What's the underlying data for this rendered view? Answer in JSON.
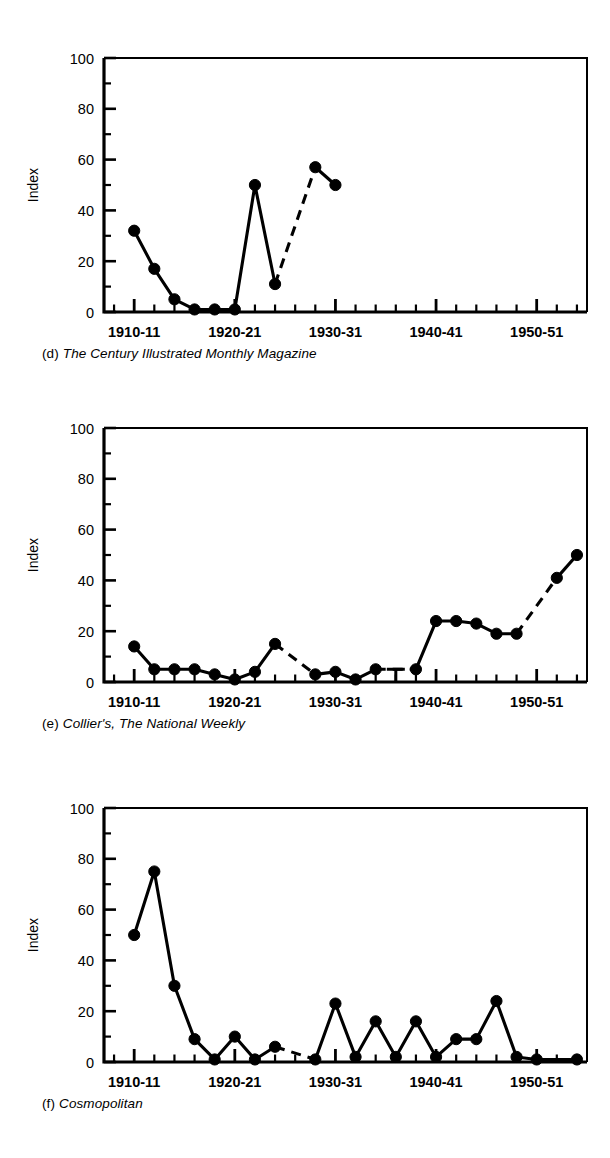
{
  "figure": {
    "panel_count": 3,
    "y_axis_label": "Index",
    "y_ticks_major": [
      0,
      20,
      40,
      60,
      80,
      100
    ],
    "y_ticks_minor": [
      10,
      30,
      50,
      70,
      90
    ],
    "y_range": [
      0,
      100
    ],
    "x_ticks_major_labels": [
      "1910-11",
      "1920-21",
      "1930-31",
      "1940-41",
      "1950-51"
    ],
    "x_ticks_major_values": [
      1910,
      1920,
      1930,
      1940,
      1950
    ],
    "x_range": [
      1907,
      1955
    ],
    "x_minor_step": 2
  },
  "panels": [
    {
      "id": "d",
      "tag": "(d)",
      "title": "The Century Illustrated Monthly Magazine",
      "caption": "(d) The Century Illustrated Monthly Magazine"
    },
    {
      "id": "e",
      "tag": "(e)",
      "title": "Collier's, The National Weekly",
      "caption": "(e) Collier's, The National Weekly"
    },
    {
      "id": "f",
      "tag": "(f)",
      "title": "Cosmopolitan",
      "caption": "(f) Cosmopolitan"
    }
  ],
  "chart_data": [
    {
      "type": "line",
      "panel": "d",
      "title": "The Century Illustrated Monthly Magazine",
      "xlabel": "",
      "ylabel": "Index",
      "ylim": [
        0,
        100
      ],
      "xlim": [
        1907,
        1955
      ],
      "grid": false,
      "legend": "none",
      "marker": "filled-circle",
      "x_tick_labels": [
        "1910-11",
        "1920-21",
        "1930-31",
        "1940-41",
        "1950-51"
      ],
      "y_tick_labels": [
        "0",
        "20",
        "40",
        "60",
        "80",
        "100"
      ],
      "x": [
        1910,
        1912,
        1914,
        1916,
        1918,
        1920,
        1922,
        1924,
        1928,
        1930
      ],
      "values": [
        32,
        17,
        5,
        1,
        1,
        1,
        50,
        11,
        57,
        50
      ],
      "segments": [
        {
          "style": "solid",
          "x": [
            1910,
            1912,
            1914,
            1916,
            1918,
            1920,
            1922,
            1924
          ],
          "values": [
            32,
            17,
            5,
            1,
            1,
            1,
            50,
            11
          ]
        },
        {
          "style": "dashed",
          "x": [
            1924,
            1928
          ],
          "values": [
            11,
            57
          ]
        },
        {
          "style": "solid",
          "x": [
            1928,
            1930
          ],
          "values": [
            57,
            50
          ]
        }
      ]
    },
    {
      "type": "line",
      "panel": "e",
      "title": "Collier's, The National Weekly",
      "xlabel": "",
      "ylabel": "Index",
      "ylim": [
        0,
        100
      ],
      "xlim": [
        1907,
        1955
      ],
      "grid": false,
      "legend": "none",
      "marker": "filled-circle",
      "x_tick_labels": [
        "1910-11",
        "1920-21",
        "1930-31",
        "1940-41",
        "1950-51"
      ],
      "y_tick_labels": [
        "0",
        "20",
        "40",
        "60",
        "80",
        "100"
      ],
      "x": [
        1910,
        1912,
        1914,
        1916,
        1918,
        1920,
        1922,
        1924,
        1928,
        1930,
        1932,
        1934,
        1938,
        1940,
        1942,
        1944,
        1946,
        1948,
        1952,
        1954
      ],
      "values": [
        14,
        5,
        5,
        5,
        3,
        1,
        4,
        15,
        3,
        4,
        1,
        5,
        5,
        24,
        24,
        23,
        19,
        19,
        41,
        50
      ],
      "gap_marker": {
        "x": 1936,
        "y": 5,
        "shape": "T-bar"
      },
      "segments": [
        {
          "style": "solid",
          "x": [
            1910,
            1912,
            1914,
            1916,
            1918,
            1920,
            1922,
            1924
          ],
          "values": [
            14,
            5,
            5,
            5,
            3,
            1,
            4,
            15
          ]
        },
        {
          "style": "dashed",
          "x": [
            1924,
            1928
          ],
          "values": [
            15,
            3
          ]
        },
        {
          "style": "solid",
          "x": [
            1928,
            1930,
            1932,
            1934
          ],
          "values": [
            3,
            4,
            1,
            5
          ]
        },
        {
          "style": "dashed",
          "x": [
            1934,
            1938
          ],
          "values": [
            5,
            5
          ]
        },
        {
          "style": "solid",
          "x": [
            1938,
            1940,
            1942,
            1944,
            1946,
            1948
          ],
          "values": [
            5,
            24,
            24,
            23,
            19,
            19
          ]
        },
        {
          "style": "dashed",
          "x": [
            1948,
            1952
          ],
          "values": [
            19,
            41
          ]
        },
        {
          "style": "solid",
          "x": [
            1952,
            1954
          ],
          "values": [
            41,
            50
          ]
        }
      ]
    },
    {
      "type": "line",
      "panel": "f",
      "title": "Cosmopolitan",
      "xlabel": "",
      "ylabel": "Index",
      "ylim": [
        0,
        100
      ],
      "xlim": [
        1907,
        1955
      ],
      "grid": false,
      "legend": "none",
      "marker": "filled-circle",
      "x_tick_labels": [
        "1910-11",
        "1920-21",
        "1930-31",
        "1940-41",
        "1950-51"
      ],
      "y_tick_labels": [
        "0",
        "20",
        "40",
        "60",
        "80",
        "100"
      ],
      "x": [
        1910,
        1912,
        1914,
        1916,
        1918,
        1920,
        1922,
        1924,
        1928,
        1930,
        1932,
        1934,
        1936,
        1938,
        1940,
        1942,
        1944,
        1946,
        1948,
        1950,
        1954
      ],
      "values": [
        50,
        75,
        30,
        9,
        1,
        10,
        1,
        6,
        1,
        23,
        2,
        16,
        2,
        16,
        2,
        9,
        9,
        24,
        2,
        1,
        1
      ],
      "segments": [
        {
          "style": "solid",
          "x": [
            1910,
            1912,
            1914,
            1916,
            1918,
            1920,
            1922,
            1924
          ],
          "values": [
            50,
            75,
            30,
            9,
            1,
            10,
            1,
            6
          ]
        },
        {
          "style": "dashed",
          "x": [
            1924,
            1928
          ],
          "values": [
            6,
            1
          ]
        },
        {
          "style": "solid",
          "x": [
            1928,
            1930,
            1932,
            1934,
            1936,
            1938,
            1940,
            1942,
            1944,
            1946,
            1948,
            1950,
            1954
          ],
          "values": [
            1,
            23,
            2,
            16,
            2,
            16,
            2,
            9,
            9,
            24,
            2,
            1,
            1
          ]
        }
      ]
    }
  ]
}
